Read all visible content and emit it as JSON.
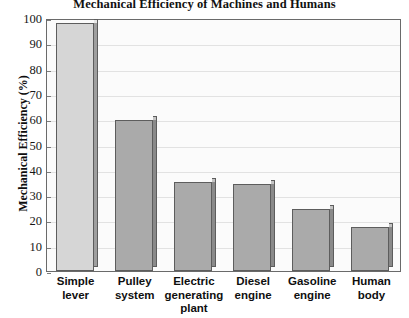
{
  "chart_data": {
    "type": "bar",
    "title": "Mechanical Efficiency of Machines and Humans",
    "xlabel": "",
    "ylabel": "Mechanical Efficiency (%)",
    "ylim": [
      0,
      100
    ],
    "ytick_step": 10,
    "yticks": [
      100,
      90,
      80,
      70,
      60,
      50,
      40,
      30,
      20,
      10,
      0
    ],
    "grid": true,
    "legend": "none",
    "categories": [
      "Simple lever",
      "Pulley system",
      "Electric generating plant",
      "Diesel engine",
      "Gasoline engine",
      "Human body"
    ],
    "category_lines": [
      [
        "Simple",
        "lever"
      ],
      [
        "Pulley",
        "system"
      ],
      [
        "Electric",
        "generating",
        "plant"
      ],
      [
        "Diesel",
        "engine"
      ],
      [
        "Gasoline",
        "engine"
      ],
      [
        "Human",
        "body"
      ]
    ],
    "values": [
      98,
      59.5,
      35,
      34.5,
      24.5,
      17.5
    ],
    "bar_colors": [
      "#d6d6d6",
      "#aaaaaa",
      "#aaaaaa",
      "#aaaaaa",
      "#aaaaaa",
      "#aaaaaa"
    ],
    "bar_side_colors": [
      "#9f9f9f",
      "#8a8a8a",
      "#8a8a8a",
      "#8a8a8a",
      "#8a8a8a",
      "#8a8a8a"
    ],
    "bar_top_colors": [
      "#e8e8e8",
      "#c4c4c4",
      "#c4c4c4",
      "#c4c4c4",
      "#c4c4c4",
      "#c4c4c4"
    ],
    "style": {
      "plot_background": "#fbfbfb",
      "frame_color": "#6a6a6a",
      "gridline_color": "#e2e2e2",
      "bar_outline": "#5d5d5d",
      "text_color": "#111111"
    }
  }
}
